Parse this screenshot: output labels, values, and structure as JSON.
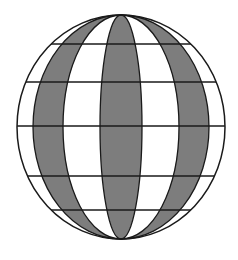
{
  "diagram": {
    "type": "globe-grid",
    "center": {
      "x": 121,
      "y": 127
    },
    "radius_x": 104,
    "radius_y": 112,
    "meridian_rx": [
      88,
      58,
      21
    ],
    "latitude_lines_y": [
      44,
      82,
      126,
      176,
      210
    ],
    "colors": {
      "stroke": "#1a1a1a",
      "shade": "#7d7d7d",
      "background": "#ffffff"
    }
  }
}
